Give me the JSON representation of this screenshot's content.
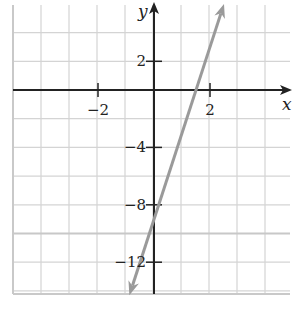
{
  "chart_data": {
    "type": "line",
    "title": "",
    "xlabel": "x",
    "ylabel": "y",
    "xlim": [
      -5,
      4.5
    ],
    "ylim": [
      -14.5,
      6
    ],
    "x_grid_step": 1,
    "y_grid_step": 2,
    "grid": true,
    "x_ticks": [
      {
        "value": -2,
        "label": "−2"
      },
      {
        "value": 2,
        "label": "2"
      }
    ],
    "y_ticks": [
      {
        "value": 2,
        "label": "2"
      },
      {
        "value": -4,
        "label": "−4"
      },
      {
        "value": -8,
        "label": "−8"
      },
      {
        "value": -12,
        "label": "−12"
      }
    ],
    "series": [
      {
        "name": "y = 6x − 9",
        "slope": 6,
        "intercept": -9,
        "x": [
          -0.88,
          0,
          1.5,
          2.5
        ],
        "y": [
          -14.3,
          -9,
          0,
          6
        ],
        "color": "#9a9a9a",
        "arrows": "both"
      }
    ],
    "colors": {
      "grid": "#d4d4d4",
      "axes": "#222222",
      "line": "#9a9a9a"
    }
  }
}
